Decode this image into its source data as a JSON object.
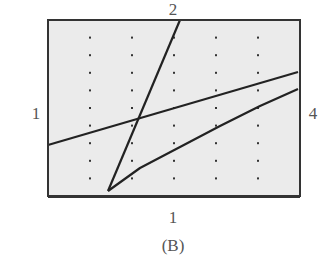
{
  "figure_label": "(B)",
  "labels": {
    "top": "2",
    "left": "1",
    "right": "4",
    "bottom": "1"
  },
  "chart_data": {
    "type": "line",
    "title": "",
    "caption": "(B)",
    "xlabel": "",
    "ylabel": "",
    "grid": "dotted",
    "axis_scale_labels": {
      "top": "2",
      "left": "1",
      "right": "4",
      "bottom": "1"
    },
    "window_px": {
      "left": 48,
      "top": 20,
      "right": 300,
      "bottom": 196
    },
    "grid_divisions": {
      "x": 6,
      "y": 10
    },
    "series": [
      {
        "name": "steep line",
        "points": [
          [
            108,
            191
          ],
          [
            180,
            20
          ]
        ]
      },
      {
        "name": "shallow line",
        "points": [
          [
            48,
            145
          ],
          [
            298,
            72
          ]
        ]
      },
      {
        "name": "curve",
        "points": [
          [
            108,
            191
          ],
          [
            140,
            168
          ],
          [
            180,
            147
          ],
          [
            220,
            126
          ],
          [
            260,
            106
          ],
          [
            298,
            89
          ]
        ]
      }
    ]
  },
  "colors": {
    "background": "#ebebeb",
    "frame": "#333333",
    "line": "#222222",
    "dot": "#333333",
    "label": "#555555"
  }
}
